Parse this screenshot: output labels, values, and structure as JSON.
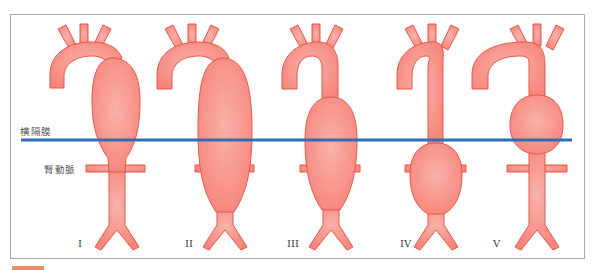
{
  "figure": {
    "labels": {
      "diaphragm": "横隔膜",
      "renal_artery": "腎動脈"
    },
    "types": [
      {
        "id": "I",
        "label": "I"
      },
      {
        "id": "II",
        "label": "II"
      },
      {
        "id": "III",
        "label": "III"
      },
      {
        "id": "IV",
        "label": "IV"
      },
      {
        "id": "V",
        "label": "V"
      }
    ],
    "colors": {
      "vessel_fill": "#f7857b",
      "vessel_highlight": "#f9b2a9",
      "vessel_stroke": "#e4574c",
      "diaphragm_line": "#2f6db5",
      "frame": "#a8a8a8",
      "accent_bar": "#f08a64"
    }
  }
}
